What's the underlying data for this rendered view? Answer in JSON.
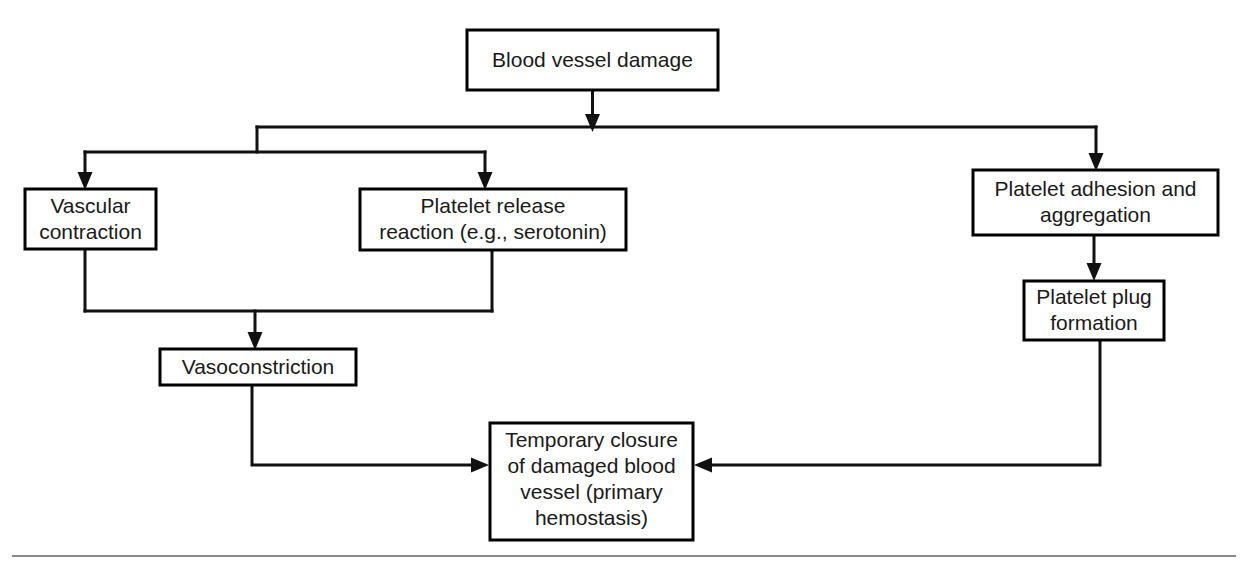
{
  "diagram": {
    "colors": {
      "box_fill": "#ffffff",
      "box_stroke": "#000000",
      "text": "#1a1a1a",
      "edge": "#111111",
      "rule": "#8a8a8a"
    },
    "nodes": {
      "blood_vessel_damage": {
        "lines": [
          "Blood vessel damage"
        ],
        "line1": "Blood vessel damage"
      },
      "vascular_contraction": {
        "lines": [
          "Vascular",
          "contraction"
        ],
        "line1": "Vascular",
        "line2": "contraction"
      },
      "platelet_release_reaction": {
        "lines": [
          "Platelet release",
          "reaction (e.g., serotonin)"
        ],
        "line1": "Platelet release",
        "line2": "reaction (e.g., serotonin)"
      },
      "platelet_adhesion_aggregation": {
        "lines": [
          "Platelet adhesion and",
          "aggregation"
        ],
        "line1": "Platelet adhesion and",
        "line2": "aggregation"
      },
      "vasoconstriction": {
        "lines": [
          "Vasoconstriction"
        ],
        "line1": "Vasoconstriction"
      },
      "platelet_plug_formation": {
        "lines": [
          "Platelet plug",
          "formation"
        ],
        "line1": "Platelet plug",
        "line2": "formation"
      },
      "temporary_closure": {
        "lines": [
          "Temporary closure",
          "of damaged blood",
          "vessel (primary",
          "hemostasis)"
        ],
        "line1": "Temporary closure",
        "line2": "of damaged blood",
        "line3": "vessel (primary",
        "line4": "hemostasis)"
      }
    },
    "edges": [
      {
        "from": "blood_vessel_damage",
        "to": "branch_bus"
      },
      {
        "from": "branch_bus",
        "to": "vascular_contraction"
      },
      {
        "from": "branch_bus",
        "to": "platelet_release_reaction"
      },
      {
        "from": "branch_bus",
        "to": "platelet_adhesion_aggregation"
      },
      {
        "from": "vascular_contraction",
        "to": "vasoconstriction"
      },
      {
        "from": "platelet_release_reaction",
        "to": "vasoconstriction"
      },
      {
        "from": "platelet_adhesion_aggregation",
        "to": "platelet_plug_formation"
      },
      {
        "from": "vasoconstriction",
        "to": "temporary_closure"
      },
      {
        "from": "platelet_plug_formation",
        "to": "temporary_closure"
      }
    ]
  }
}
